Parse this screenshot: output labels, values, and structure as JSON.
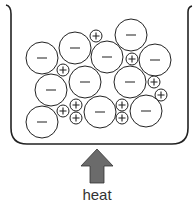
{
  "diagram": {
    "heat_label": "heat",
    "arrow_color": "#6b6b6b",
    "negative_symbol": "−",
    "positive_symbol": "+",
    "negative_ions": [
      {
        "x": 42,
        "y": 58,
        "r": 16
      },
      {
        "x": 75,
        "y": 48,
        "r": 16
      },
      {
        "x": 107,
        "y": 57,
        "r": 16
      },
      {
        "x": 131,
        "y": 35,
        "r": 16
      },
      {
        "x": 155,
        "y": 60,
        "r": 16
      },
      {
        "x": 51,
        "y": 90,
        "r": 16
      },
      {
        "x": 85,
        "y": 82,
        "r": 16
      },
      {
        "x": 130,
        "y": 82,
        "r": 16
      },
      {
        "x": 42,
        "y": 122,
        "r": 16
      },
      {
        "x": 100,
        "y": 112,
        "r": 16
      },
      {
        "x": 146,
        "y": 111,
        "r": 16
      }
    ],
    "positive_ions": [
      {
        "x": 96,
        "y": 36,
        "r": 6
      },
      {
        "x": 63,
        "y": 70,
        "r": 6
      },
      {
        "x": 132,
        "y": 59,
        "r": 6
      },
      {
        "x": 154,
        "y": 82,
        "r": 6
      },
      {
        "x": 161,
        "y": 95,
        "r": 6
      },
      {
        "x": 63,
        "y": 111,
        "r": 6
      },
      {
        "x": 76,
        "y": 105,
        "r": 6
      },
      {
        "x": 76,
        "y": 118,
        "r": 6
      },
      {
        "x": 122,
        "y": 105,
        "r": 6
      },
      {
        "x": 122,
        "y": 118,
        "r": 6
      }
    ]
  }
}
